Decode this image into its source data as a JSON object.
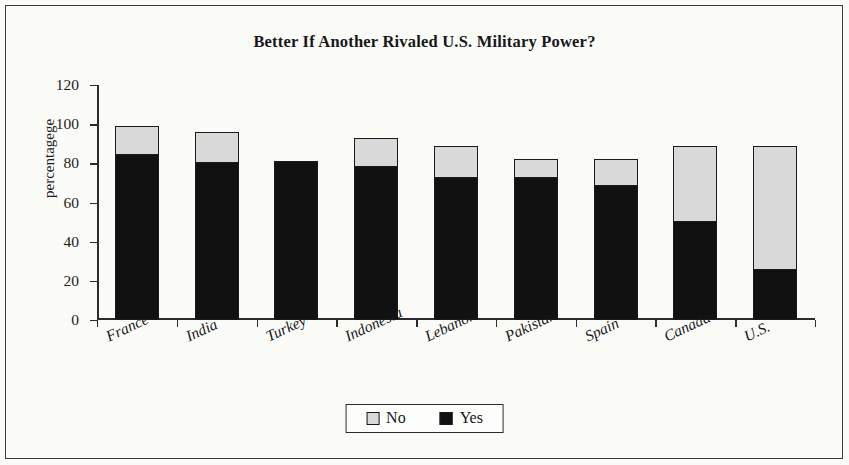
{
  "chart_data": {
    "type": "bar",
    "subtype": "stacked-bar",
    "title": "Better If Another Rivaled U.S. Military Power?",
    "xlabel": "",
    "ylabel": "percentagege",
    "ylim": [
      0,
      120
    ],
    "yticks": [
      0,
      20,
      40,
      60,
      80,
      100,
      120
    ],
    "grid": false,
    "legend_position": "bottom",
    "categories": [
      "France",
      "India",
      "Turkey",
      "Indonesia",
      "Lebanon",
      "Pakistan",
      "Spain",
      "Canada",
      "U.S."
    ],
    "series": [
      {
        "name": "Yes",
        "color": "#111111",
        "values": [
          85,
          81,
          81,
          79,
          73,
          73,
          69,
          51,
          26
        ]
      },
      {
        "name": "No",
        "color": "#d9d9d9",
        "values": [
          14,
          15,
          0,
          14,
          16,
          9,
          13,
          38,
          63
        ]
      }
    ],
    "totals": [
      99,
      96,
      81,
      93,
      89,
      82,
      82,
      89,
      89
    ]
  },
  "legend": {
    "items": [
      {
        "label": "No",
        "swatch": "light-gray"
      },
      {
        "label": "Yes",
        "swatch": "black"
      }
    ]
  }
}
